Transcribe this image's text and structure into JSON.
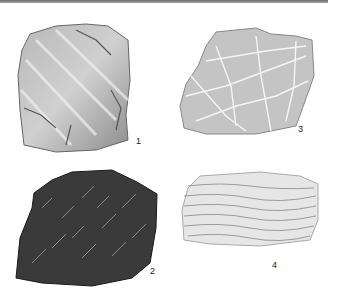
{
  "figure": {
    "specimens": [
      {
        "number": "1",
        "texture": "banded gray rock with diagonal light streaks and dark fractures"
      },
      {
        "number": "2",
        "texture": "dark gray/black schistose rock with fine light streaks"
      },
      {
        "number": "3",
        "texture": "pale gray rock crossed by white veins"
      },
      {
        "number": "4",
        "texture": "light gray finely layered rock with horizontal laminations"
      }
    ]
  }
}
